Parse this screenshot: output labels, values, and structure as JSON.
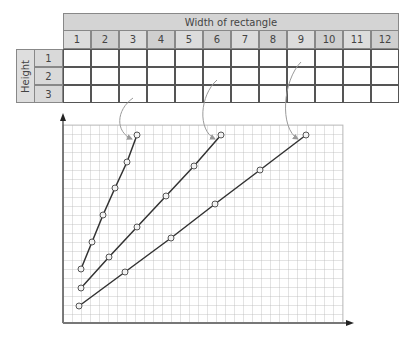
{
  "table": {
    "header_title": "Width of rectangle",
    "row_label": "Height",
    "widths": [
      "1",
      "2",
      "3",
      "4",
      "5",
      "6",
      "7",
      "8",
      "9",
      "10",
      "11",
      "12"
    ],
    "heights": [
      "1",
      "2",
      "3"
    ],
    "cells": [
      [
        "",
        "",
        "",
        "",
        "",
        "",
        "",
        "",
        "",
        "",
        "",
        ""
      ],
      [
        "",
        "",
        "",
        "",
        "",
        "",
        "",
        "",
        "",
        "",
        "",
        ""
      ],
      [
        "",
        "",
        "",
        "",
        "",
        "",
        "",
        "",
        "",
        "",
        "",
        ""
      ]
    ]
  },
  "chart_data": {
    "type": "line",
    "title": "",
    "xlabel": "",
    "ylabel": "",
    "grid": true,
    "axis_ticks_labeled": false,
    "series": [
      {
        "name": "from table cell (height 3, width 3)",
        "points_px": [
          [
            81,
            269
          ],
          [
            92,
            242
          ],
          [
            103,
            215
          ],
          [
            115,
            188
          ],
          [
            127,
            162
          ],
          [
            137,
            135
          ]
        ]
      },
      {
        "name": "from table cell (height 2, width 6)",
        "points_px": [
          [
            81,
            288
          ],
          [
            109,
            257
          ],
          [
            137,
            227
          ],
          [
            166,
            196
          ],
          [
            194,
            166
          ],
          [
            221,
            135
          ]
        ]
      },
      {
        "name": "from table cell (height 1, width 9)",
        "points_px": [
          [
            79,
            306
          ],
          [
            125,
            272
          ],
          [
            171,
            238
          ],
          [
            215,
            204
          ],
          [
            260,
            170
          ],
          [
            306,
            135
          ]
        ]
      }
    ],
    "annotations": [
      {
        "type": "curved-arrow",
        "from": "row 3, column 3",
        "to": "series 1 top point"
      },
      {
        "type": "curved-arrow",
        "from": "row 2, column 6",
        "to": "series 2 top point"
      },
      {
        "type": "curved-arrow",
        "from": "row 1, column 9",
        "to": "series 3 top point"
      }
    ]
  }
}
